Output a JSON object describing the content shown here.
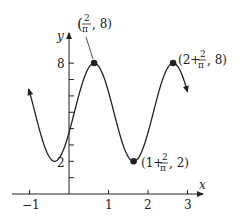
{
  "chart_data": {
    "type": "line",
    "title": "",
    "function": "y = 5 + 3 cos(pi x - 2)",
    "xlabel": "x",
    "ylabel": "y",
    "xlim": [
      -1.05,
      3.3
    ],
    "ylim": [
      0,
      8.8
    ],
    "x_ticks": [
      -1,
      1,
      2,
      3
    ],
    "x_tick_labels": [
      "−1",
      "1",
      "2",
      "3"
    ],
    "y_ticks": [
      1,
      2,
      3,
      4,
      5,
      6,
      7,
      8
    ],
    "y_tick_labels_shown": {
      "2": "2",
      "8": "8"
    },
    "grid": false,
    "points": [
      {
        "x": 0.6366,
        "y": 8,
        "label": "(2/π, 8)"
      },
      {
        "x": 1.6366,
        "y": 2,
        "label": "(1 + 2/π, 2)"
      },
      {
        "x": 2.6366,
        "y": 8,
        "label": "(2 + 2/π, 8)"
      }
    ],
    "curve_domain": [
      -1.02,
      3.0
    ]
  },
  "labels": {
    "x_axis": "x",
    "y_axis": "y",
    "tick_m1": "−1",
    "tick_1": "1",
    "tick_2": "2",
    "tick_3": "3",
    "ytick_2": "2",
    "ytick_8": "8",
    "p1_open": "(",
    "p1_close": ", 8)",
    "p2_open": "(1+",
    "p2_close": ", 2)",
    "p3_open": "(2+",
    "p3_close": ", 8)",
    "frac_num": "2",
    "frac_den": "π"
  },
  "colors": {
    "ink": "#222222",
    "background": "#ffffff"
  }
}
